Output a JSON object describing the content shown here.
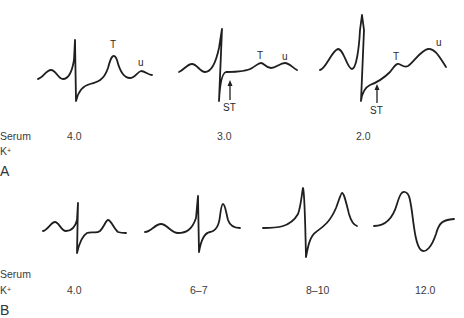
{
  "panels": [
    {
      "id": "A",
      "label": "A",
      "row_label_line1": "Serum",
      "row_label_line2": "K",
      "row_label_sup": "+",
      "description": "Hypokalemia ECG progression",
      "waveforms": [
        {
          "serum_k": "4.0",
          "annotations": [
            "T",
            "u"
          ]
        },
        {
          "serum_k": "3.0",
          "annotations": [
            "T",
            "u",
            "ST"
          ]
        },
        {
          "serum_k": "2.0",
          "annotations": [
            "T",
            "u",
            "ST"
          ]
        }
      ]
    },
    {
      "id": "B",
      "label": "B",
      "row_label_line1": "Serum",
      "row_label_line2": "K",
      "row_label_sup": "+",
      "description": "Hyperkalemia ECG progression",
      "waveforms": [
        {
          "serum_k": "4.0"
        },
        {
          "serum_k": "6–7"
        },
        {
          "serum_k": "8–10"
        },
        {
          "serum_k": "12.0"
        }
      ]
    }
  ],
  "annotations": {
    "t_wave": "T",
    "u_wave": "u",
    "st_segment": "ST"
  },
  "colors": {
    "trace": "#1f1f1f",
    "text": "#3a3a3a",
    "background": "#ffffff"
  }
}
